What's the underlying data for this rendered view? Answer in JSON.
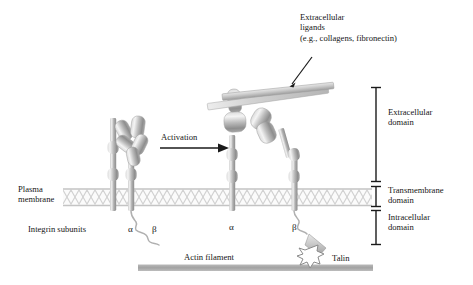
{
  "figure": {
    "type": "diagram",
    "colors": {
      "text": "#161616",
      "membrane": "#d6d6d6",
      "protein_light": "#f2f2f2",
      "protein_mid": "#b8b8b8",
      "protein_dark": "#8a8a8a",
      "actin": "#a6a6a6",
      "ligand": "#c9c9c9",
      "bracket": "#1a1a1a"
    }
  },
  "labels": {
    "ligands": "Extracellular\nligands\n(e.g., collagens, fibronectin)",
    "extracellular_domain": "Extracellular\ndomain",
    "transmembrane_domain": "Transmembrane\ndomain",
    "intracellular_domain": "Intracellular\ndomain",
    "plasma_membrane": "Plasma\nmembrane",
    "integrin_subunits": "Integrin subunits",
    "activation": "Activation",
    "actin_filament": "Actin filament",
    "talin": "Talin",
    "alpha_left": "α",
    "beta_left": "β",
    "alpha_middle": "α",
    "beta_middle": "β"
  },
  "regions": {
    "brackets": [
      {
        "name": "extracellular",
        "y_top": 87,
        "y_bottom": 182
      },
      {
        "name": "transmembrane",
        "y_top": 186,
        "y_bottom": 207
      },
      {
        "name": "intracellular",
        "y_top": 210,
        "y_bottom": 245
      }
    ],
    "membrane": {
      "y_top": 188,
      "y_bottom": 206,
      "x_left": 63,
      "x_right": 372
    },
    "actin": {
      "y": 268,
      "x_left": 138,
      "x_right": 373
    }
  },
  "structures": {
    "inactive_integrin": {
      "state": "bent",
      "x_center": 122
    },
    "active_integrin": {
      "state": "extended",
      "x_alpha": 232,
      "x_beta": 296
    },
    "ligand_bars": 2
  }
}
